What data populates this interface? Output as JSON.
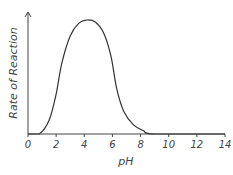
{
  "chart_data": {
    "type": "line",
    "title": "",
    "xlabel": "pH",
    "ylabel": "Rate of Reaction",
    "xlim": [
      0,
      14
    ],
    "ylim": [
      0,
      1
    ],
    "xticks": [
      0,
      2,
      4,
      6,
      8,
      10,
      12,
      14
    ],
    "yticks": [],
    "grid": false,
    "legend": null,
    "series": [
      {
        "name": "Enzyme activity",
        "x": [
          0,
          0.8,
          1.5,
          2.0,
          2.4,
          3.0,
          3.6,
          4.2,
          4.8,
          5.4,
          5.9,
          6.3,
          6.8,
          7.5,
          8.2,
          9.0,
          14
        ],
        "values": [
          0,
          0,
          0.12,
          0.35,
          0.62,
          0.86,
          0.97,
          1.0,
          0.98,
          0.88,
          0.68,
          0.4,
          0.2,
          0.08,
          0.03,
          0,
          0
        ]
      }
    ],
    "annotations": [
      "Rate peaks near pH 4.2"
    ]
  },
  "colors": {
    "curve": "#333333",
    "axis": "#444444",
    "text": "#444444",
    "background": "#ffffff"
  }
}
